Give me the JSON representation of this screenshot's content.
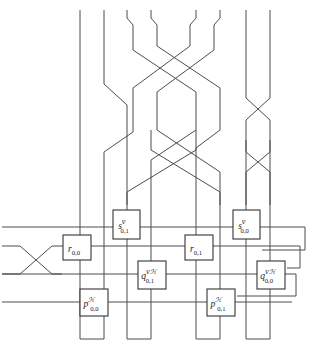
{
  "figure": {
    "width": 314,
    "height": 346,
    "background": "#ffffff",
    "wire_color": "#4d4d4d",
    "box_stroke": "#333333",
    "box_fill": "#ffffff"
  },
  "boxes": [
    {
      "id": "s01",
      "base": "s",
      "sup": "ᴠ",
      "sub": "0,1",
      "label": "s^V_{0,1}",
      "x": 113,
      "y": 210,
      "w": 27,
      "h": 29
    },
    {
      "id": "s00",
      "base": "s",
      "sup": "ᴠ",
      "sub": "0,0",
      "label": "s^V_{0,0}",
      "x": 233,
      "y": 210,
      "w": 27,
      "h": 29
    },
    {
      "id": "r00",
      "base": "r",
      "sup": "",
      "sub": "0,0",
      "label": "r_{0,0}",
      "x": 63,
      "y": 235,
      "w": 28,
      "h": 25
    },
    {
      "id": "r01",
      "base": "r",
      "sup": "",
      "sub": "0,1",
      "label": "r_{0,1}",
      "x": 185,
      "y": 235,
      "w": 28,
      "h": 25
    },
    {
      "id": "q01",
      "base": "q",
      "sup": "ᴠℋ",
      "sub": "0,1",
      "label": "q^{VH}_{0,1}",
      "x": 138,
      "y": 261,
      "w": 28,
      "h": 28
    },
    {
      "id": "q00",
      "base": "q",
      "sup": "ᴠℋ",
      "sub": "0,0",
      "label": "q^{VH}_{0,0}",
      "x": 257,
      "y": 261,
      "w": 28,
      "h": 28
    },
    {
      "id": "p00",
      "base": "p",
      "sup": "ℋ",
      "sub": "0,0",
      "label": "p^H_{0,0}",
      "x": 80,
      "y": 289,
      "w": 28,
      "h": 27
    },
    {
      "id": "p01",
      "base": "p",
      "sup": "ℋ",
      "sub": "0,1",
      "label": "p^H_{0,1}",
      "x": 207,
      "y": 289,
      "w": 28,
      "h": 27
    }
  ],
  "horizontal_lines": [
    {
      "id": "h1",
      "y": 227,
      "x1": 2,
      "x2": 305
    },
    {
      "id": "h2",
      "y": 246,
      "x1": 2,
      "x2": 300
    },
    {
      "id": "h3",
      "y": 274,
      "x1": 2,
      "x2": 296
    },
    {
      "id": "h4",
      "y": 302,
      "x1": 2,
      "x2": 292
    }
  ],
  "vertical_wires": [
    {
      "id": "w1",
      "x_top": 80,
      "x_bottom": 80
    },
    {
      "id": "w2",
      "x_top": 104,
      "x_bottom": 104
    },
    {
      "id": "w3",
      "x_top": 127,
      "x_bottom": 127
    },
    {
      "id": "w4",
      "x_top": 151,
      "x_bottom": 151
    },
    {
      "id": "w5",
      "x_top": 196,
      "x_bottom": 196
    },
    {
      "id": "w6",
      "x_top": 220,
      "x_bottom": 220
    },
    {
      "id": "w7",
      "x_top": 246,
      "x_bottom": 246
    },
    {
      "id": "w8",
      "x_top": 270,
      "x_bottom": 270
    }
  ],
  "bottom_loops": [
    {
      "id": "u1",
      "x1": 80,
      "x2": 104,
      "y": 339
    },
    {
      "id": "u2",
      "x1": 127,
      "x2": 151,
      "y": 339
    },
    {
      "id": "u3",
      "x1": 196,
      "x2": 220,
      "y": 339
    },
    {
      "id": "u4",
      "x1": 246,
      "x2": 270,
      "y": 339
    }
  ],
  "crossings": [
    {
      "id": "left-x-crossing",
      "x1": 2,
      "x2": 62,
      "y_top": 243,
      "y_bottom": 271
    },
    {
      "id": "upper-braid",
      "note": "wire crossings in upper half"
    },
    {
      "id": "mid-braid",
      "note": "long X crossing mid-diagram"
    }
  ]
}
